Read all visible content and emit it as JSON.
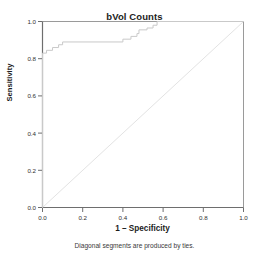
{
  "chart_data": {
    "type": "line",
    "title": "bVol Counts",
    "subtitle": "",
    "xlabel": "1 – Specificity",
    "ylabel": "Sensitivity",
    "xlim": [
      0.0,
      1.0
    ],
    "ylim": [
      0.0,
      1.0
    ],
    "xticks": [
      0.0,
      0.2,
      0.4,
      0.6,
      0.8,
      1.0
    ],
    "yticks": [
      0.0,
      0.2,
      0.4,
      0.6,
      0.8,
      1.0
    ],
    "xticklabels": [
      "0.0",
      "0.2",
      "0.4",
      "0.6",
      "0.8",
      "1.0"
    ],
    "yticklabels": [
      "0.0",
      "0.2",
      "0.4",
      "0.6",
      "0.8",
      "1.0"
    ],
    "grid": false,
    "legend": false,
    "legend_position": "none",
    "annotation": "Diagonal segments are produced by ties.",
    "series": [
      {
        "name": "ROC curve",
        "type": "step",
        "color": "#c9c9c9",
        "x": [
          0.0,
          0.0,
          0.02,
          0.02,
          0.05,
          0.05,
          0.08,
          0.08,
          0.1,
          0.1,
          0.4,
          0.4,
          0.44,
          0.44,
          0.47,
          0.47,
          0.48,
          0.48,
          0.52,
          0.52,
          0.55,
          0.55,
          0.57,
          0.57,
          1.0
        ],
        "y": [
          0.0,
          0.83,
          0.83,
          0.845,
          0.845,
          0.86,
          0.86,
          0.875,
          0.875,
          0.89,
          0.89,
          0.905,
          0.905,
          0.92,
          0.92,
          0.935,
          0.935,
          0.955,
          0.955,
          0.965,
          0.965,
          0.98,
          0.98,
          1.0,
          1.0
        ]
      },
      {
        "name": "Reference line",
        "type": "line",
        "color": "#e3e3e3",
        "x": [
          0.0,
          1.0
        ],
        "y": [
          0.0,
          1.0
        ]
      }
    ]
  },
  "chart": {
    "title": "bVol Counts",
    "xlabel": "1 – Specificity",
    "ylabel": "Sensitivity",
    "footnote": "Diagonal segments are produced by ties."
  }
}
